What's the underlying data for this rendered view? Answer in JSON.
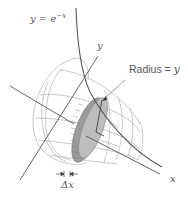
{
  "figure": {
    "curve_label": {
      "lhs": "y = e",
      "exponent": "−x"
    },
    "axes": {
      "x_label": "x",
      "y_label": "y"
    },
    "radius_label": {
      "text": "Radius = ",
      "var": "y"
    },
    "thickness_label": "Δx",
    "colors": {
      "curve": "#555555",
      "axis": "#555555",
      "wireframe": "#aaaaaa",
      "disk_fill": "#9a9a9a",
      "disk_face": "#b8b8b8",
      "text": "#555555"
    }
  }
}
